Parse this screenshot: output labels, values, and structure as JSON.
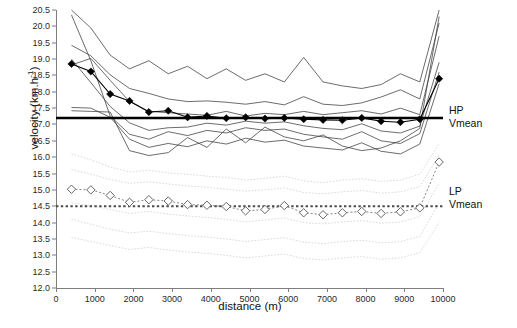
{
  "chart_data": {
    "type": "line",
    "title": "",
    "xlabel": "distance (m)",
    "ylabel_text": "velocity (km.h",
    "ylabel_sup": "-1",
    "ylabel_tail": ")",
    "xlim": [
      0,
      10000
    ],
    "ylim": [
      12.0,
      20.5
    ],
    "grid": false,
    "legend_position": "right-outside",
    "xticks": [
      0,
      1000,
      2000,
      3000,
      4000,
      5000,
      6000,
      7000,
      8000,
      9000,
      10000
    ],
    "yticks": [
      12.0,
      12.5,
      13.0,
      13.5,
      14.0,
      14.5,
      15.0,
      15.5,
      16.0,
      16.5,
      17.0,
      17.5,
      18.0,
      18.5,
      19.0,
      19.5,
      20.0,
      20.5
    ],
    "annotations": [
      {
        "name": "hp-vmean-label",
        "line1": "HP",
        "line2": "Vmean",
        "value": 17.2
      },
      {
        "name": "lp-vmean-label",
        "line1": "LP",
        "line2": "Vmean",
        "value": 14.5
      }
    ],
    "reference_lines": [
      {
        "name": "HP Vmean",
        "y": 17.2,
        "style": "solid-thick-black"
      },
      {
        "name": "LP Vmean",
        "y": 14.5,
        "style": "dotted-thick-gray"
      }
    ],
    "x": [
      400,
      900,
      1400,
      1900,
      2400,
      2900,
      3400,
      3900,
      4400,
      4900,
      5400,
      5900,
      6400,
      6900,
      7400,
      7900,
      8400,
      8900,
      9400,
      9900
    ],
    "series": [
      {
        "name": "HP mean",
        "group": "HP",
        "marker": "filled-diamond",
        "color": "#000000",
        "values": [
          18.85,
          18.62,
          17.93,
          17.72,
          17.38,
          17.42,
          17.22,
          17.26,
          17.19,
          17.22,
          17.18,
          17.2,
          17.16,
          17.14,
          17.13,
          17.2,
          17.1,
          17.07,
          17.16,
          18.4
        ]
      },
      {
        "name": "LP mean",
        "group": "LP",
        "marker": "open-diamond",
        "color": "#555555",
        "values": [
          15.02,
          15.0,
          14.83,
          14.62,
          14.7,
          14.66,
          14.55,
          14.53,
          14.49,
          14.36,
          14.4,
          14.52,
          14.3,
          14.24,
          14.3,
          14.34,
          14.28,
          14.33,
          14.45,
          15.85
        ]
      },
      {
        "name": "HP individual 1",
        "group": "HP-individual",
        "values": [
          20.5,
          19.95,
          19.12,
          18.7,
          18.95,
          18.55,
          18.78,
          18.4,
          18.7,
          18.35,
          18.55,
          18.3,
          19.05,
          18.3,
          18.18,
          18.1,
          18.22,
          18.55,
          18.3,
          20.5
        ]
      },
      {
        "name": "HP individual 2",
        "group": "HP-individual",
        "values": [
          19.42,
          19.1,
          18.52,
          18.1,
          17.95,
          17.78,
          17.7,
          17.72,
          17.68,
          17.62,
          17.7,
          17.6,
          17.85,
          17.62,
          17.58,
          17.66,
          17.84,
          18.06,
          17.78,
          20.1
        ]
      },
      {
        "name": "HP individual 3",
        "group": "HP-individual",
        "values": [
          18.82,
          19.02,
          18.35,
          17.7,
          17.4,
          17.36,
          17.32,
          17.28,
          17.4,
          17.26,
          17.34,
          17.3,
          17.4,
          17.3,
          17.36,
          17.42,
          17.32,
          17.5,
          17.3,
          19.7
        ]
      },
      {
        "name": "HP individual 4",
        "group": "HP-individual",
        "values": [
          19.0,
          18.28,
          17.55,
          17.05,
          16.82,
          16.9,
          16.92,
          17.04,
          16.98,
          17.1,
          17.04,
          17.08,
          16.96,
          16.88,
          16.84,
          17.02,
          16.8,
          16.74,
          16.95,
          18.9
        ]
      },
      {
        "name": "HP individual 5",
        "group": "HP-individual",
        "values": [
          20.35,
          18.95,
          17.26,
          16.7,
          16.55,
          16.78,
          16.66,
          16.82,
          16.74,
          16.9,
          16.82,
          16.86,
          16.7,
          16.62,
          16.55,
          16.78,
          16.5,
          16.42,
          16.72,
          18.6
        ]
      },
      {
        "name": "HP individual 6",
        "group": "HP-individual",
        "values": [
          17.52,
          17.5,
          17.22,
          16.55,
          16.3,
          16.42,
          16.32,
          16.5,
          16.4,
          16.58,
          16.46,
          16.52,
          16.34,
          16.28,
          16.22,
          16.44,
          16.18,
          16.1,
          16.4,
          18.25
        ]
      },
      {
        "name": "HP individual 7",
        "group": "HP-individual",
        "values": [
          17.42,
          17.4,
          17.38,
          16.2,
          16.05,
          16.14,
          16.6,
          16.3,
          16.86,
          16.44,
          16.92,
          16.62,
          16.5,
          16.68,
          16.34,
          16.2,
          16.28,
          16.5,
          16.88,
          20.3
        ]
      },
      {
        "name": "LP individual 1",
        "group": "LP-individual",
        "values": [
          16.1,
          15.92,
          15.7,
          15.55,
          15.6,
          15.52,
          15.48,
          15.42,
          15.38,
          15.3,
          15.35,
          15.42,
          15.28,
          15.22,
          15.3,
          15.34,
          15.26,
          15.3,
          15.48,
          16.4
        ]
      },
      {
        "name": "LP individual 2",
        "group": "LP-individual",
        "values": [
          15.62,
          15.48,
          15.32,
          15.2,
          15.25,
          15.18,
          15.12,
          15.08,
          15.02,
          14.96,
          15.0,
          15.06,
          14.92,
          14.88,
          14.94,
          14.98,
          14.9,
          14.94,
          15.1,
          16.05
        ]
      },
      {
        "name": "LP individual 3",
        "group": "LP-individual",
        "values": [
          14.6,
          14.52,
          14.4,
          14.28,
          14.34,
          14.26,
          14.2,
          14.16,
          14.1,
          14.02,
          14.08,
          14.14,
          14.0,
          13.96,
          14.02,
          14.06,
          13.98,
          14.02,
          14.18,
          15.2
        ]
      },
      {
        "name": "LP individual 4",
        "group": "LP-individual",
        "values": [
          14.1,
          13.95,
          13.8,
          13.68,
          13.74,
          13.66,
          13.6,
          13.56,
          13.5,
          13.42,
          13.48,
          13.54,
          13.4,
          13.36,
          13.42,
          13.46,
          13.38,
          13.42,
          13.58,
          14.6
        ]
      },
      {
        "name": "LP individual 5",
        "group": "LP-individual",
        "values": [
          13.55,
          13.42,
          13.3,
          13.18,
          13.24,
          13.16,
          13.1,
          13.06,
          13.0,
          12.92,
          12.98,
          13.04,
          12.9,
          12.86,
          12.92,
          12.96,
          12.88,
          12.92,
          13.08,
          14.0
        ]
      }
    ]
  }
}
